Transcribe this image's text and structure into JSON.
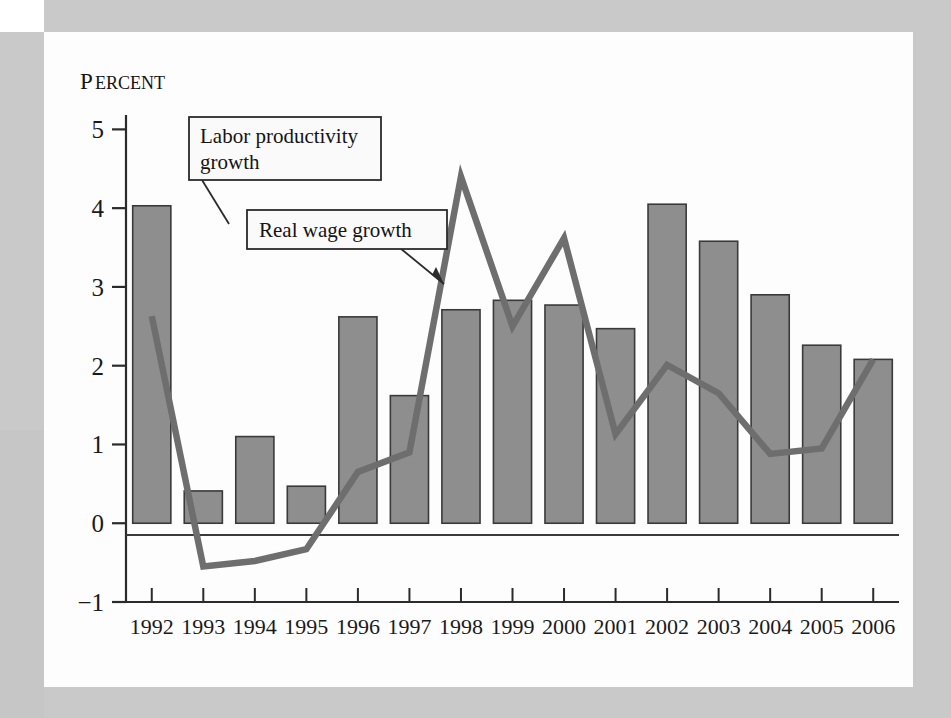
{
  "chart_data": {
    "type": "bar",
    "title": "",
    "subtitle": "",
    "ylabel": "Percent",
    "ylabel_cap": "P",
    "ylabel_rest": "ERCENT",
    "xlabel": "",
    "categories": [
      "1992",
      "1993",
      "1994",
      "1995",
      "1996",
      "1997",
      "1998",
      "1999",
      "2000",
      "2001",
      "2002",
      "2003",
      "2004",
      "2005",
      "2006"
    ],
    "ylim": [
      -1,
      5.5
    ],
    "yticks": [
      5,
      4,
      3,
      2,
      1,
      0,
      -1
    ],
    "ytick_labels": [
      "5",
      "4",
      "3",
      "2",
      "1",
      "0",
      "−1"
    ],
    "grid": false,
    "legend_position": "callout-annotations",
    "series": [
      {
        "name": "Labor productivity growth",
        "render": "bar",
        "color": "#8e8e8e",
        "edge_color": "#3a3a3a",
        "values": [
          4.03,
          0.41,
          1.1,
          0.47,
          2.62,
          1.62,
          2.71,
          2.83,
          2.77,
          2.47,
          4.05,
          3.58,
          2.9,
          2.26,
          2.08
        ]
      },
      {
        "name": "Real wage growth",
        "render": "line",
        "color": "#6e6e6e",
        "values": [
          2.63,
          -0.55,
          -0.48,
          -0.33,
          0.65,
          0.9,
          4.4,
          2.5,
          3.62,
          1.13,
          2.01,
          1.65,
          0.88,
          0.95,
          2.08
        ]
      }
    ],
    "annotations": [
      {
        "id": "labor-callout",
        "text_line1": "Labor productivity",
        "text_line2": "growth",
        "points_to": "bar-1992"
      },
      {
        "id": "wage-callout",
        "text_line1": "Real wage growth",
        "text_line2": "",
        "points_to": "line-1998"
      }
    ]
  },
  "frame": {
    "background_color": "#c9c9c9",
    "page_color": "#fdfdfd"
  }
}
